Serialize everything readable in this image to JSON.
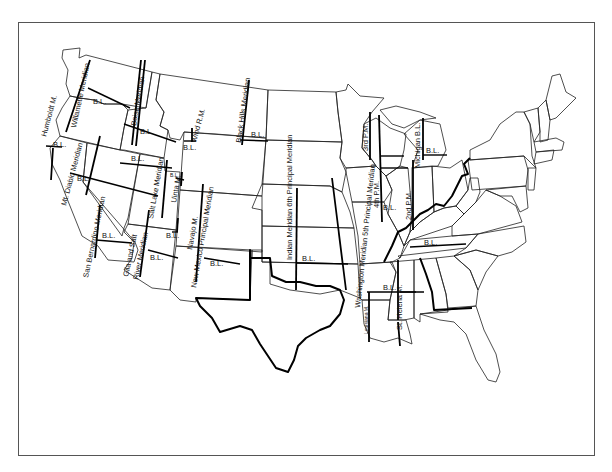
{
  "map": {
    "subject": "Principal meridians and base lines of the contiguous United States",
    "colors": {
      "background": "#ffffff",
      "lines": "#000000",
      "frame": "#555555"
    },
    "meridians": [
      {
        "id": "humboldt",
        "label": "Humboldt M."
      },
      {
        "id": "willamette",
        "label": "Willamette Meridian"
      },
      {
        "id": "boise",
        "label": "Boise Meridian"
      },
      {
        "id": "mt-diablo",
        "label": "Mt. Diablo Meridian"
      },
      {
        "id": "wind-river",
        "label": "Wind R.M."
      },
      {
        "id": "black-hills",
        "label": "Black Hills Meridian"
      },
      {
        "id": "salt-lake",
        "label": "Salt Lake Meridian"
      },
      {
        "id": "uinta",
        "label": "Uinta M."
      },
      {
        "id": "navajo",
        "label": "Navajo M."
      },
      {
        "id": "san-bernardino",
        "label": "San Bernardino Meridian"
      },
      {
        "id": "gila-salt",
        "label_line1": "Gila and Salt",
        "label_line2": "River Meridian"
      },
      {
        "id": "new-mexico",
        "label": "New Mexico Principal Meridian"
      },
      {
        "id": "indian-6th",
        "label": "Indian Meridian 6th Principal Meridian"
      },
      {
        "id": "washington-5th",
        "label": "Washington Meridian 5th Principal Meridian"
      },
      {
        "id": "louisiana",
        "label": "Louisiana M."
      },
      {
        "id": "third-pm",
        "label": "3rd P.M."
      },
      {
        "id": "fourth-pm",
        "label": "4th P.M."
      },
      {
        "id": "second-pm",
        "label": "2nd P.M."
      },
      {
        "id": "michigan",
        "label": "Michigan B.L."
      },
      {
        "id": "st-helena",
        "label": "St. Helena M."
      }
    ],
    "baseline_label": "B.L."
  }
}
